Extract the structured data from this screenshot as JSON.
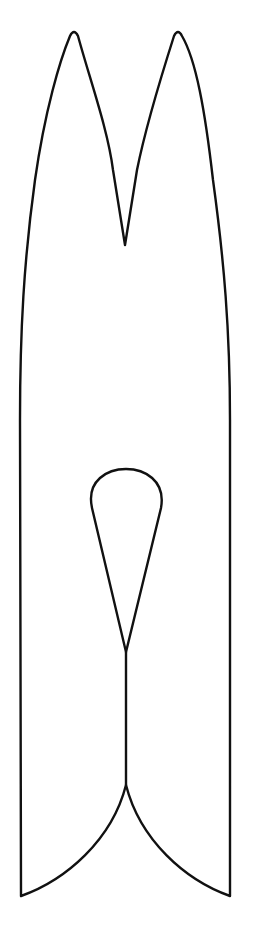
{
  "figure": {
    "stroke_color": "#111111",
    "background_color": "#ffffff"
  },
  "shapes": {
    "outer_outline": "clothespin-body",
    "inner_hole": "teardrop-spring-hole",
    "center_split": "slit-line",
    "bottom_notch": "curved-v-notch"
  }
}
